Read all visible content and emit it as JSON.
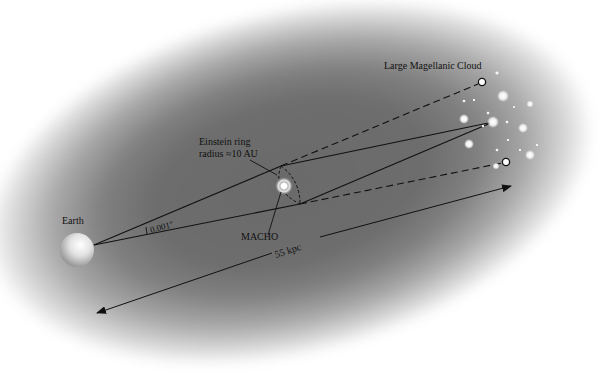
{
  "diagram": {
    "labels": {
      "lmc": "Large Magellanic Cloud",
      "einstein_line1": "Einstein ring",
      "einstein_line2": "radius ≈10 AU",
      "macho": "MACHO",
      "earth": "Earth",
      "angle": "0.001″",
      "distance": "55 kpc"
    },
    "colors": {
      "background_center": "#6a6a6a",
      "background_edge": "#ffffff",
      "lines": "#111111",
      "stars": "#f4f4f4"
    },
    "nodes": [
      {
        "id": "earth",
        "label": "Earth"
      },
      {
        "id": "macho",
        "label": "MACHO"
      },
      {
        "id": "source-star",
        "label": "LMC source star"
      },
      {
        "id": "image-upper",
        "label": "apparent image (upper)"
      },
      {
        "id": "image-lower",
        "label": "apparent image (lower)"
      }
    ],
    "edges": [
      {
        "from": "earth",
        "to": "macho",
        "style": "solid",
        "note": "upper ray to Einstein ring"
      },
      {
        "from": "earth",
        "to": "macho",
        "style": "solid",
        "note": "lower ray to Einstein ring"
      },
      {
        "from": "macho",
        "to": "source-star",
        "style": "solid"
      },
      {
        "from": "macho",
        "to": "image-upper",
        "style": "dashed"
      },
      {
        "from": "macho",
        "to": "image-lower",
        "style": "dashed"
      },
      {
        "from": "earth",
        "to": "source-star",
        "style": "double-arrow",
        "label": "55 kpc"
      }
    ]
  }
}
